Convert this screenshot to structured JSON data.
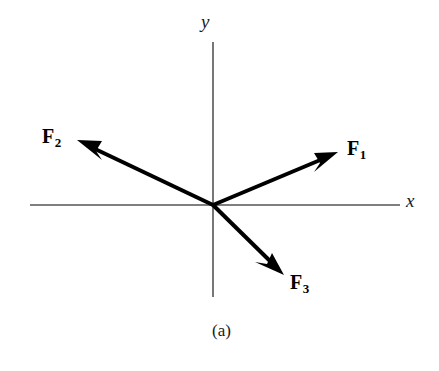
{
  "figure": {
    "caption": "(a)",
    "background_color": "#ffffff",
    "width": 439,
    "height": 371
  },
  "axes": {
    "x_label": "x",
    "y_label": "y",
    "color": "#555555",
    "origin": {
      "x": 213,
      "y": 205
    },
    "x_axis": {
      "x1": 30,
      "y1": 205,
      "x2": 400,
      "y2": 205
    },
    "y_axis": {
      "x1": 213,
      "y1": 42,
      "x2": 213,
      "y2": 297
    }
  },
  "vectors": [
    {
      "name": "F1",
      "label": "F",
      "subscript": "1",
      "color": "#000000",
      "tail": {
        "x": 213,
        "y": 205
      },
      "tip": {
        "x": 338,
        "y": 152
      },
      "quadrant": "I",
      "angle_deg": 23
    },
    {
      "name": "F2",
      "label": "F",
      "subscript": "2",
      "color": "#000000",
      "tail": {
        "x": 213,
        "y": 205
      },
      "tip": {
        "x": 77,
        "y": 140
      },
      "quadrant": "II",
      "angle_deg": 154
    },
    {
      "name": "F3",
      "label": "F",
      "subscript": "3",
      "color": "#000000",
      "tail": {
        "x": 213,
        "y": 205
      },
      "tip": {
        "x": 284,
        "y": 275
      },
      "quadrant": "IV",
      "angle_deg": -44
    }
  ]
}
